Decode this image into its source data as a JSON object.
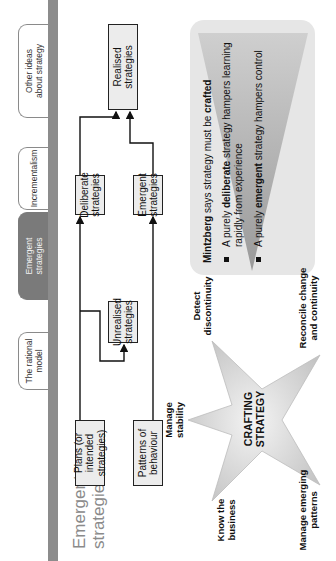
{
  "slide": {
    "title_line1": "Emergent",
    "title_line2": "strategies",
    "rotation": "90deg counter-clockwise"
  },
  "tabs": [
    {
      "label_line1": "The rational",
      "label_line2": "model",
      "active": false
    },
    {
      "label_line1": "Emergent",
      "label_line2": "strategies",
      "active": true
    },
    {
      "label_line1": "Incrementalism",
      "label_line2": "",
      "active": false
    },
    {
      "label_line1": "Other ideas",
      "label_line2": "about strategy",
      "active": false
    }
  ],
  "diagram": {
    "plans": {
      "line1": "Plans (or intended",
      "line2": "strategies)"
    },
    "patterns": {
      "line1": "Patterns of",
      "line2": "behaviour"
    },
    "unrealised": {
      "line1": "Unrealised",
      "line2": "strategies"
    },
    "deliberate": {
      "line1": "Deliberate",
      "line2": "strategies"
    },
    "emergent": {
      "line1": "Emergent",
      "line2": "strategies"
    },
    "realised": {
      "line1": "Realised",
      "line2": "strategies"
    }
  },
  "star": {
    "center_line1": "CRAFTING",
    "center_line2": "STRATEGY",
    "points": {
      "top": {
        "line1": "Manage",
        "line2": "stability"
      },
      "right_top": {
        "line1": "Detect",
        "line2": "discontinuity"
      },
      "right_bottom": {
        "line1": "Reconcile change",
        "line2": "and continuity"
      },
      "left_bottom": {
        "line1": "Manage emerging",
        "line2": "patterns"
      },
      "left_top": {
        "line1": "Know the",
        "line2": "business"
      }
    }
  },
  "callout": {
    "intro_bold": "Mintzberg",
    "intro_mid": " says strategy must be ",
    "intro_bold2": "crafted",
    "bullets": [
      {
        "pre": "A purely ",
        "bold": "deliberate",
        "post": " strategy hampers learning rapidly from experience"
      },
      {
        "pre": "A purely ",
        "bold": "emergent",
        "post": " strategy hampers control"
      }
    ]
  },
  "colors": {
    "grey_bar": "#8c8c8c",
    "active_tab": "#7a7a7a",
    "title": "#8a8a8a",
    "box_fill": "#ececec",
    "callout_bg": "#e6e6e6",
    "callout_triangle": "#a8a8a8"
  }
}
